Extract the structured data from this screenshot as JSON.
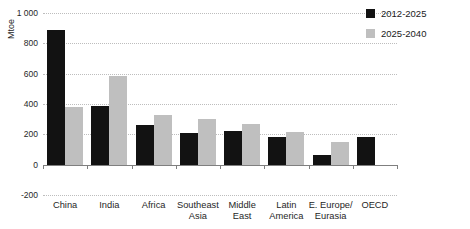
{
  "chart_data": {
    "type": "bar",
    "title": "",
    "xlabel": "",
    "ylabel": "Mtoe",
    "ylim": [
      -200,
      1000
    ],
    "grid": "dotted-horizontal",
    "legend_position": "top-right",
    "yticks": [
      {
        "label": "1 000",
        "value": 1000
      },
      {
        "label": "800",
        "value": 800
      },
      {
        "label": "600",
        "value": 600
      },
      {
        "label": "400",
        "value": 400
      },
      {
        "label": "200",
        "value": 200
      },
      {
        "label": "0",
        "value": 0
      },
      {
        "label": "-200",
        "value": -200
      }
    ],
    "categories": [
      "China",
      "India",
      "Africa",
      "Southeast\nAsia",
      "Middle\nEast",
      "Latin\nAmerica",
      "E. Europe/\nEurasia",
      "OECD"
    ],
    "series": [
      {
        "name": "2012-2025",
        "color": "#121212",
        "values": [
          890,
          390,
          260,
          210,
          225,
          180,
          65,
          180
        ]
      },
      {
        "name": "2025-2040",
        "color": "#bfbfbf",
        "values": [
          380,
          585,
          330,
          300,
          265,
          215,
          150,
          0
        ]
      }
    ]
  }
}
